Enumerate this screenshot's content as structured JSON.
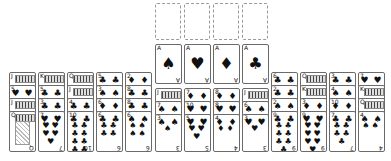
{
  "game": "Solitaire",
  "foundations": [
    {
      "id": "foundation-1",
      "state": "empty"
    },
    {
      "id": "foundation-2",
      "state": "empty"
    },
    {
      "id": "foundation-3",
      "state": "empty"
    },
    {
      "id": "foundation-4",
      "state": "empty"
    }
  ],
  "aces": [
    {
      "rank": "A",
      "suit": "♠",
      "suit_name": "spades"
    },
    {
      "rank": "A",
      "suit": "♥",
      "suit_name": "hearts"
    },
    {
      "rank": "A",
      "suit": "♦",
      "suit_name": "diamonds"
    },
    {
      "rank": "A",
      "suit": "♣",
      "suit_name": "clubs"
    }
  ],
  "tableau": [
    {
      "x": 9,
      "cards": [
        {
          "rank": "J",
          "suit": "♠",
          "face": true
        },
        {
          "rank": "5",
          "suit": "♥"
        },
        {
          "rank": "J",
          "suit": "♣",
          "face": true
        },
        {
          "rank": "Q",
          "suit": "♠",
          "face": true,
          "top": true
        }
      ]
    },
    {
      "x": 38,
      "cards": [
        {
          "rank": "K",
          "suit": "♠",
          "face": true
        },
        {
          "rank": "5",
          "suit": "♣"
        },
        {
          "rank": "3",
          "suit": "♣"
        },
        {
          "rank": "7",
          "suit": "♥",
          "top": true
        }
      ]
    },
    {
      "x": 67,
      "cards": [
        {
          "rank": "Q",
          "suit": "♣",
          "face": true
        },
        {
          "rank": "J",
          "suit": "♣",
          "face": true
        },
        {
          "rank": "4",
          "suit": "♣"
        },
        {
          "rank": "10",
          "suit": "♣",
          "top": true
        }
      ]
    },
    {
      "x": 96,
      "cards": [
        {
          "rank": "5",
          "suit": "♣"
        },
        {
          "rank": "3",
          "suit": "♠"
        },
        {
          "rank": "6",
          "suit": "♦"
        },
        {
          "rank": "6",
          "suit": "♣",
          "top": true
        }
      ]
    },
    {
      "x": 125,
      "cards": [
        {
          "rank": "2",
          "suit": "♦"
        },
        {
          "rank": "8",
          "suit": "♣"
        },
        {
          "rank": "8",
          "suit": "♣"
        },
        {
          "rank": "6",
          "suit": "♠",
          "top": true
        }
      ]
    },
    {
      "x": 155,
      "cards": [
        {
          "rank": "J",
          "suit": "♦",
          "face": true
        },
        {
          "rank": "7",
          "suit": "♠"
        },
        {
          "rank": "3",
          "suit": "♠",
          "top": true
        }
      ]
    },
    {
      "x": 184,
      "cards": [
        {
          "rank": "7",
          "suit": "♦"
        },
        {
          "rank": "10",
          "suit": "♥"
        },
        {
          "rank": "5",
          "suit": "♥",
          "top": true
        }
      ]
    },
    {
      "x": 213,
      "cards": [
        {
          "rank": "8",
          "suit": "♦"
        },
        {
          "rank": "8",
          "suit": "♥"
        },
        {
          "rank": "4",
          "suit": "♦",
          "top": true
        }
      ]
    },
    {
      "x": 242,
      "cards": [
        {
          "rank": "J",
          "suit": "♥",
          "face": true
        },
        {
          "rank": "6",
          "suit": "♠"
        },
        {
          "rank": "3",
          "suit": "♥",
          "top": true
        }
      ]
    },
    {
      "x": 271,
      "cards": [
        {
          "rank": "6",
          "suit": "♣"
        },
        {
          "rank": "2",
          "suit": "♣"
        },
        {
          "rank": "2",
          "suit": "♠"
        },
        {
          "rank": "9",
          "suit": "♣",
          "top": true
        }
      ]
    },
    {
      "x": 300,
      "cards": [
        {
          "rank": "Q",
          "suit": "♠",
          "face": true
        },
        {
          "rank": "K",
          "suit": "♦",
          "face": true
        },
        {
          "rank": "3",
          "suit": "♦"
        },
        {
          "rank": "9",
          "suit": "♥",
          "top": true
        }
      ]
    },
    {
      "x": 329,
      "cards": [
        {
          "rank": "3",
          "suit": "♣"
        },
        {
          "rank": "4",
          "suit": "♠"
        },
        {
          "rank": "10",
          "suit": "♦"
        },
        {
          "rank": "7",
          "suit": "♣",
          "top": true
        }
      ]
    },
    {
      "x": 358,
      "cards": [
        {
          "rank": "7",
          "suit": "♥"
        },
        {
          "rank": "K",
          "suit": "♥",
          "face": true
        },
        {
          "rank": "Q",
          "suit": "♥",
          "face": true
        },
        {
          "rank": "4",
          "suit": "♠",
          "top": true
        }
      ]
    }
  ]
}
